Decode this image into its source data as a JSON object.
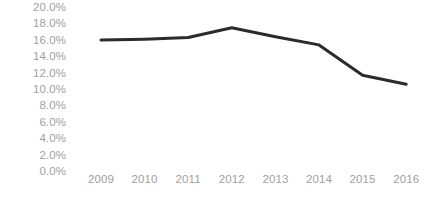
{
  "chart_data": {
    "type": "line",
    "title": "",
    "subtitle": "",
    "xlabel": "",
    "ylabel": "",
    "categories": [
      "2009",
      "2010",
      "2011",
      "2012",
      "2013",
      "2014",
      "2015",
      "2016"
    ],
    "values": [
      0.161,
      0.162,
      0.164,
      0.176,
      0.165,
      0.155,
      0.118,
      0.107
    ],
    "value_labels": [
      "16.1%",
      "16.2%",
      "16.4%",
      "17.6%",
      "16.5%",
      "15.5%",
      "11.8%",
      "10.7%"
    ],
    "series": [
      {
        "name": "",
        "values": [
          0.161,
          0.162,
          0.164,
          0.176,
          0.165,
          0.155,
          0.118,
          0.107
        ],
        "color": "#2b2b2b"
      }
    ],
    "ylim": [
      0.0,
      0.2
    ],
    "y_ticks": [
      0.2,
      0.18,
      0.16,
      0.14,
      0.12,
      0.1,
      0.08,
      0.06,
      0.04,
      0.02,
      0.0
    ],
    "y_tick_labels": [
      "20.0%",
      "18.0%",
      "16.0%",
      "14.0%",
      "12.0%",
      "10.0%",
      "8.0%",
      "6.0%",
      "4.0%",
      "2.0%",
      "0.0%"
    ],
    "x_tick_labels": [
      "2009",
      "2010",
      "2011",
      "2012",
      "2013",
      "2014",
      "2015",
      "2016"
    ],
    "grid": false,
    "legend": false,
    "legend_position": "none",
    "markers": false,
    "annotations": [],
    "colors": {
      "line": "#2b2b2b",
      "tick_label": "#a0a0a0",
      "background": "#ffffff"
    }
  }
}
